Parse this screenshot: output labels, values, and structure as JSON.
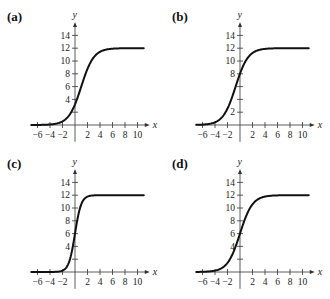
{
  "chart_data": [
    {
      "type": "line",
      "panel": "(a)",
      "title": "(a)",
      "xlabel": "x",
      "ylabel": "y",
      "xticks": [
        -6,
        -4,
        -2,
        2,
        4,
        6,
        8,
        10
      ],
      "xtick_labels": [
        "−6",
        "−4",
        "−2",
        "2",
        "4",
        "6",
        "8",
        "10"
      ],
      "yticks": [
        2,
        4,
        6,
        8,
        10,
        12,
        14
      ],
      "ytick_labels": [
        "",
        "4",
        "6",
        "8",
        "10",
        "12",
        "14"
      ],
      "xlim": [
        -7,
        11
      ],
      "ylim": [
        -2,
        15
      ],
      "grid": false,
      "curve": {
        "kind": "logistic",
        "L": 12,
        "k": 1.0,
        "x0": 1.0
      },
      "x": [
        -7,
        -6,
        -4,
        -2,
        -1,
        0,
        1,
        2,
        3,
        4,
        5,
        6,
        8,
        10,
        11
      ],
      "y": [
        0.0,
        0.0,
        0.1,
        0.6,
        1.4,
        3.2,
        6.0,
        8.8,
        10.6,
        11.4,
        11.8,
        11.9,
        12.0,
        12.0,
        12.0
      ]
    },
    {
      "type": "line",
      "panel": "(b)",
      "title": "(b)",
      "xlabel": "x",
      "ylabel": "y",
      "xticks": [
        -6,
        -4,
        -2,
        2,
        4,
        6,
        8,
        10
      ],
      "xtick_labels": [
        "−6",
        "−4",
        "−2",
        "2",
        "4",
        "6",
        "8",
        "10"
      ],
      "yticks": [
        2,
        4,
        6,
        8,
        10,
        12,
        14
      ],
      "ytick_labels": [
        "2",
        "",
        "",
        "8",
        "10",
        "12",
        "14"
      ],
      "xlim": [
        -7,
        11
      ],
      "ylim": [
        -2,
        15
      ],
      "grid": false,
      "curve": {
        "kind": "logistic",
        "L": 12,
        "k": 1.0,
        "x0": -0.7
      },
      "x": [
        -7,
        -6,
        -4,
        -3,
        -2,
        -1,
        0,
        1,
        2,
        3,
        4,
        6,
        8,
        10,
        11
      ],
      "y": [
        0.0,
        0.1,
        0.4,
        0.9,
        2.5,
        5.2,
        8.0,
        10.2,
        11.3,
        11.7,
        11.9,
        12.0,
        12.0,
        12.0,
        12.0
      ]
    },
    {
      "type": "line",
      "panel": "(c)",
      "title": "(c)",
      "xlabel": "x",
      "ylabel": "y",
      "xticks": [
        -6,
        -4,
        -2,
        2,
        4,
        6,
        8,
        10
      ],
      "xtick_labels": [
        "−6",
        "−4",
        "−2",
        "2",
        "4",
        "6",
        "8",
        "10"
      ],
      "yticks": [
        2,
        4,
        6,
        8,
        10,
        12,
        14
      ],
      "ytick_labels": [
        "",
        "4",
        "6",
        "8",
        "10",
        "12",
        "14"
      ],
      "xlim": [
        -7,
        11
      ],
      "ylim": [
        -2,
        15
      ],
      "grid": false,
      "curve": {
        "kind": "logistic",
        "L": 12,
        "k": 2.0,
        "x0": 0.0
      },
      "x": [
        -7,
        -6,
        -4,
        -2,
        -1,
        -0.5,
        0,
        0.5,
        1,
        2,
        3,
        4,
        6,
        8,
        10,
        11
      ],
      "y": [
        0.0,
        0.0,
        0.0,
        0.2,
        1.4,
        3.2,
        6.0,
        8.8,
        10.6,
        11.8,
        12.0,
        12.0,
        12.0,
        12.0,
        12.0,
        12.0
      ]
    },
    {
      "type": "line",
      "panel": "(d)",
      "title": "(d)",
      "xlabel": "x",
      "ylabel": "y",
      "xticks": [
        -6,
        -4,
        -2,
        2,
        4,
        6,
        8,
        10
      ],
      "xtick_labels": [
        "−6",
        "−4",
        "−2",
        "2",
        "4",
        "6",
        "8",
        "10"
      ],
      "yticks": [
        2,
        4,
        6,
        8,
        10,
        12,
        14
      ],
      "ytick_labels": [
        "",
        "4",
        "6",
        "8",
        "10",
        "12",
        "14"
      ],
      "xlim": [
        -7,
        11
      ],
      "ylim": [
        -2,
        15
      ],
      "grid": false,
      "curve": {
        "kind": "logistic",
        "L": 12,
        "k": 1.0,
        "x0": 0.0
      },
      "x": [
        -7,
        -6,
        -4,
        -2,
        -1,
        0,
        1,
        2,
        3,
        4,
        5,
        6,
        8,
        10,
        11
      ],
      "y": [
        0.0,
        0.0,
        0.2,
        1.4,
        3.2,
        6.0,
        8.8,
        10.6,
        11.4,
        11.8,
        11.9,
        12.0,
        12.0,
        12.0,
        12.0
      ]
    }
  ],
  "panels": [
    {
      "label": "(a)",
      "ox": 75,
      "oy": 125
    },
    {
      "label": "(b)",
      "ox": 240,
      "oy": 125
    },
    {
      "label": "(c)",
      "ox": 75,
      "oy": 272
    },
    {
      "label": "(d)",
      "ox": 240,
      "oy": 272
    }
  ],
  "colors": {
    "curve": "#111111",
    "axis": "#333333",
    "text": "#222222"
  }
}
